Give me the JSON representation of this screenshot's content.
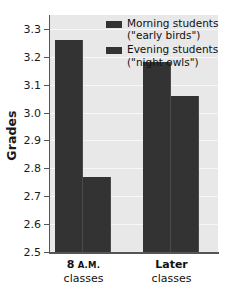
{
  "chart_data": {
    "type": "bar",
    "title": "",
    "xlabel": "",
    "ylabel": "Grades",
    "ylim": [
      2.5,
      3.35
    ],
    "ytick_labels": [
      "3.3",
      "3.2",
      "3.1",
      "3.0",
      "2.9",
      "2.8",
      "2.7",
      "2.6",
      "2.5"
    ],
    "ytick_values": [
      3.3,
      3.2,
      3.1,
      3.0,
      2.9,
      2.8,
      2.7,
      2.6,
      2.5
    ],
    "grid": true,
    "legend_position": "top-right",
    "categories": [
      "8 A.M. classes",
      "Later classes"
    ],
    "category_lines": [
      {
        "line1_main": "8",
        "line1_smallcaps": "A.M.",
        "line2": "classes"
      },
      {
        "line1_main": "Later",
        "line1_smallcaps": "",
        "line2": "classes"
      }
    ],
    "series": [
      {
        "name": "Morning students (\"early birds\")",
        "label_main": "Morning students",
        "label_sub": "(\"early birds\")",
        "color": "#333333",
        "values": [
          3.26,
          3.18
        ]
      },
      {
        "name": "Evening students (\"night owls\")",
        "label_main": "Evening students",
        "label_sub": "(\"night owls\")",
        "color": "#333333",
        "values": [
          2.77,
          3.06
        ]
      }
    ]
  },
  "style": {
    "plot_background": "#e8e8e8",
    "gridline_color": "#f7f7f7",
    "axis_color": "#555555",
    "bar_color": "#333333",
    "text_color": "#111111"
  }
}
